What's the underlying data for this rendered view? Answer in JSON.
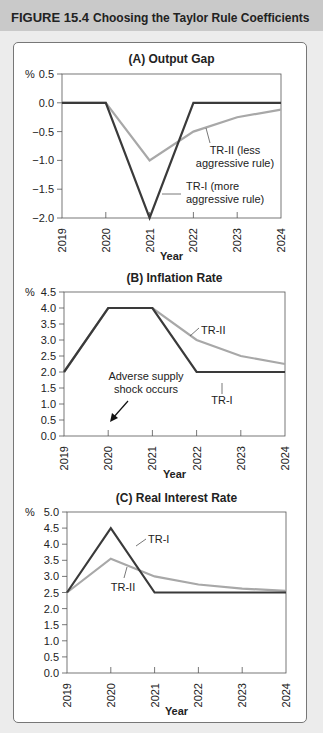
{
  "figure": {
    "number": "FIGURE 15.4",
    "title": "Choosing the Taylor Rule Coefficients"
  },
  "colors": {
    "header_bg": "#c9c9c9",
    "tr1": "#3a3a3a",
    "tr2": "#a8a8a8"
  },
  "chart_data": [
    {
      "type": "line",
      "title": "(A) Output Gap",
      "xlabel": "Year",
      "ylabel": "%",
      "x": [
        "2019",
        "2020",
        "2021",
        "2022",
        "2023",
        "2024"
      ],
      "yticks": [
        "0.5",
        "0.0",
        "−0.5",
        "−1.0",
        "−1.5",
        "−2.0"
      ],
      "ylim": [
        -2.0,
        0.5
      ],
      "series": [
        {
          "name": "TR-I (more aggressive rule)",
          "values": [
            0,
            0,
            -2.0,
            0,
            0,
            0
          ]
        },
        {
          "name": "TR-II (less aggressive rule)",
          "values": [
            0,
            0,
            -1.0,
            -0.5,
            -0.25,
            -0.12
          ]
        }
      ],
      "annotations": [
        {
          "label_line1": "TR-II (less",
          "label_line2": "aggressive rule)"
        },
        {
          "label_line1": "TR-I (more",
          "label_line2": "aggressive rule)"
        }
      ]
    },
    {
      "type": "line",
      "title": "(B) Inflation Rate",
      "xlabel": "Year",
      "ylabel": "%",
      "x": [
        "2019",
        "2020",
        "2021",
        "2022",
        "2023",
        "2024"
      ],
      "yticks": [
        "4.5",
        "4.0",
        "3.5",
        "3.0",
        "2.5",
        "2.0",
        "1.5",
        "1.0",
        "0.5",
        "0.0"
      ],
      "ylim": [
        0.0,
        4.5
      ],
      "series": [
        {
          "name": "TR-I",
          "values": [
            2.0,
            4.0,
            4.0,
            2.0,
            2.0,
            2.0
          ]
        },
        {
          "name": "TR-II",
          "values": [
            2.0,
            4.0,
            4.0,
            3.0,
            2.5,
            2.25
          ]
        }
      ],
      "annotations": [
        {
          "label_line1": "TR-II"
        },
        {
          "label_line1": "TR-I"
        },
        {
          "label_line1": "Adverse supply",
          "label_line2": "shock occurs",
          "points_to": "2020"
        }
      ]
    },
    {
      "type": "line",
      "title": "(C) Real Interest Rate",
      "xlabel": "Year",
      "ylabel": "%",
      "x": [
        "2019",
        "2020",
        "2021",
        "2022",
        "2023",
        "2024"
      ],
      "yticks": [
        "5.0",
        "4.5",
        "4.0",
        "3.5",
        "3.0",
        "2.5",
        "2.0",
        "1.5",
        "1.0",
        "0.5",
        "0.0"
      ],
      "ylim": [
        0.0,
        5.0
      ],
      "series": [
        {
          "name": "TR-I",
          "values": [
            2.5,
            4.5,
            2.5,
            2.5,
            2.5,
            2.5
          ]
        },
        {
          "name": "TR-II",
          "values": [
            2.5,
            3.55,
            3.0,
            2.75,
            2.62,
            2.55
          ]
        }
      ],
      "annotations": [
        {
          "label_line1": "TR-I"
        },
        {
          "label_line1": "TR-II"
        }
      ]
    }
  ]
}
